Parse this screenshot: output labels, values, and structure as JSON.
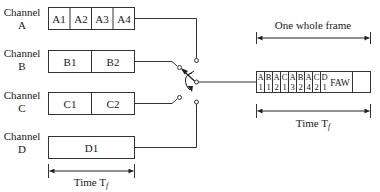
{
  "channels": [
    {
      "label_line1": "Channel",
      "label_line2": "A",
      "cells": [
        "A1",
        "A2",
        "A3",
        "A4"
      ]
    },
    {
      "label_line1": "Channel",
      "label_line2": "B",
      "cells": [
        "B1",
        "B2"
      ]
    },
    {
      "label_line1": "Channel",
      "label_line2": "C",
      "cells": [
        "C1",
        "C2"
      ]
    },
    {
      "label_line1": "Channel",
      "label_line2": "D",
      "cells": [
        "D1"
      ]
    }
  ],
  "left_time": {
    "label": "Time T",
    "subscript": "f"
  },
  "frame": {
    "title": "One whole frame",
    "slots": [
      {
        "top": "A",
        "bottom": "1"
      },
      {
        "top": "B",
        "bottom": "1"
      },
      {
        "top": "A",
        "bottom": "2"
      },
      {
        "top": "C",
        "bottom": "1"
      },
      {
        "top": "A",
        "bottom": "3"
      },
      {
        "top": "B",
        "bottom": "2"
      },
      {
        "top": "A",
        "bottom": "4"
      },
      {
        "top": "C",
        "bottom": "2"
      },
      {
        "top": "D",
        "bottom": "1"
      }
    ],
    "faw_label": "FAW"
  },
  "right_time": {
    "label": "Time T",
    "subscript": "f"
  }
}
